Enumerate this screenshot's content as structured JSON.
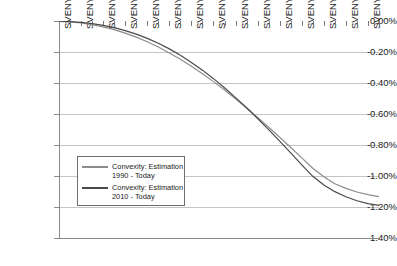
{
  "chart_data": {
    "type": "line",
    "title": "",
    "xlabel": "",
    "ylabel": "",
    "ylim": [
      -1.4,
      0.0
    ],
    "ytick_labels": [
      "0.00%",
      "-0.20%",
      "-0.40%",
      "-0.60%",
      "-0.80%",
      "-1.00%",
      "-1.20%",
      "-1.40%"
    ],
    "ytick_values": [
      0.0,
      -0.2,
      -0.4,
      -0.6,
      -0.8,
      -1.0,
      -1.2,
      -1.4
    ],
    "grid": true,
    "legend_position": "center-left",
    "categories": [
      "SVENY01",
      "SVENY02",
      "SVENY03",
      "SVENY04",
      "SVENY05",
      "SVENY06",
      "SVENY07",
      "SVENY08",
      "SVENY09",
      "SVENY10",
      "SVENY11",
      "SVENY12",
      "SVENY13",
      "SVENY14",
      "SVENY15",
      "SVENY16",
      "SVENY17",
      "SVENY18",
      "SVENY19",
      "SVENY20",
      "SVENY21",
      "SVENY22",
      "SVENY23",
      "SVENY24",
      "SVENY25",
      "SVENY26",
      "SVENY27",
      "SVENY28",
      "SVENY29",
      "SVENY30"
    ],
    "tick_labels_shown": [
      "SVENY01",
      "SVENY03",
      "SVENY05",
      "SVENY07",
      "SVENY09",
      "SVENY11",
      "SVENY13",
      "SVENY15",
      "SVENY17",
      "SVENY19",
      "SVENY21",
      "SVENY23",
      "SVENY25",
      "SVENY27",
      "SVENY29"
    ],
    "series": [
      {
        "name": "Convexity: Estimation 1990 - Today",
        "color": "#8c8c8c",
        "values": [
          -0.002,
          -0.006,
          -0.013,
          -0.024,
          -0.038,
          -0.056,
          -0.078,
          -0.104,
          -0.134,
          -0.168,
          -0.206,
          -0.247,
          -0.292,
          -0.34,
          -0.391,
          -0.445,
          -0.502,
          -0.561,
          -0.622,
          -0.685,
          -0.75,
          -0.816,
          -0.883,
          -0.95,
          -1.005,
          -1.05,
          -1.08,
          -1.103,
          -1.12,
          -1.133
        ]
      },
      {
        "name": "Convexity: Estimation 2010 - Today",
        "color": "#4a4a4a",
        "values": [
          -0.001,
          -0.004,
          -0.009,
          -0.017,
          -0.028,
          -0.043,
          -0.062,
          -0.085,
          -0.112,
          -0.144,
          -0.18,
          -0.221,
          -0.267,
          -0.317,
          -0.372,
          -0.431,
          -0.494,
          -0.56,
          -0.629,
          -0.701,
          -0.775,
          -0.851,
          -0.928,
          -1.002,
          -1.058,
          -1.101,
          -1.134,
          -1.16,
          -1.178,
          -1.19
        ]
      }
    ]
  },
  "legend": {
    "entries": [
      {
        "line1": "Convexity: Estimation",
        "line2": "1990 - Today",
        "color": "#8c8c8c"
      },
      {
        "line1": "Convexity: Estimation",
        "line2": "2010 - Today",
        "color": "#4a4a4a"
      }
    ]
  }
}
